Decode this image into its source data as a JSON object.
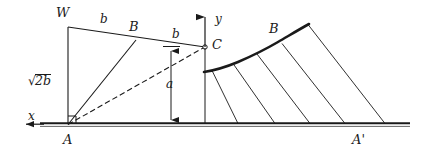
{
  "figure": {
    "type": "geometry-diagram",
    "background_color": "#ffffff",
    "line_color": "#1a1a1a",
    "width": 426,
    "height": 159,
    "labels": {
      "point_w": "W",
      "point_b_left": "B",
      "point_c": "C",
      "point_a": "A",
      "point_b_right": "B",
      "point_a_prime": "A'",
      "axis_x": "x",
      "axis_y": "y",
      "seg_wb": "b",
      "seg_bc": "b",
      "height_a": "a",
      "side_wa_radical": "√",
      "side_wa_radicand": "2b"
    },
    "points": {
      "W": {
        "x": 68,
        "y": 27
      },
      "Bl": {
        "x": 136,
        "y": 40
      },
      "C": {
        "x": 205,
        "y": 47
      },
      "A": {
        "x": 68,
        "y": 125
      },
      "Br": {
        "x": 285,
        "y": 42
      },
      "Ap": {
        "x": 360,
        "y": 125
      }
    },
    "baseline": {
      "x1": 40,
      "x2": 410,
      "y": 125
    },
    "dimension_line_a": {
      "x": 171,
      "y_top": 47,
      "y_bottom": 125
    },
    "axis_x_arrow": {
      "x_from": 44,
      "x_to": 23,
      "y": 125
    },
    "axis_y_arrow": {
      "x": 205,
      "y_from": 47,
      "y_to": 12
    },
    "curve_chords_count": 5
  }
}
